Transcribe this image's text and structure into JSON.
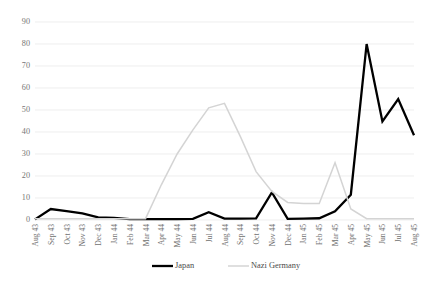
{
  "chart_data": {
    "type": "line",
    "title": "",
    "xlabel": "",
    "ylabel": "",
    "ylim": [
      0,
      90
    ],
    "ystep": 10,
    "grid": true,
    "legend_position": "bottom",
    "categories": [
      "Aug 43",
      "Sep 43",
      "Oct 43",
      "Nov 43",
      "Dec 43",
      "Jan 44",
      "Feb 44",
      "Mar 44",
      "Apr 44",
      "May 44",
      "Jun 44",
      "Jul 44",
      "Aug 44",
      "Sep 44",
      "Oct 44",
      "Nov 44",
      "Dec 44",
      "Jan 45",
      "Feb 45",
      "Mar 45",
      "Apr 45",
      "May 45",
      "Jun 45",
      "Jul 45",
      "Aug 45"
    ],
    "ytick_labels": [
      "0",
      "10",
      "20",
      "30",
      "40",
      "50",
      "60",
      "70",
      "80",
      "90"
    ],
    "series": [
      {
        "name": "Japan",
        "color": "#000000",
        "width": 2.3,
        "values": [
          0.3,
          5.0,
          4.0,
          3.0,
          1.2,
          1.0,
          0.4,
          0.4,
          0.4,
          0.4,
          0.5,
          3.5,
          0.6,
          0.6,
          0.7,
          12.5,
          0.5,
          0.6,
          0.8,
          4.0,
          11.5,
          80.0,
          44.8,
          55.0,
          38.5
        ]
      },
      {
        "name": "Nazi Germany",
        "color": "#d4d4d4",
        "width": 1.5,
        "values": [
          0.6,
          0.6,
          0.6,
          0.6,
          0.6,
          0.6,
          0.6,
          0.6,
          16.0,
          30.0,
          41.0,
          51.0,
          53.0,
          38.0,
          22.0,
          13.0,
          8.0,
          7.5,
          7.5,
          26.0,
          5.0,
          0.6,
          0.6,
          0.6,
          0.6
        ]
      }
    ]
  },
  "legend": {
    "items": [
      {
        "label": "Japan"
      },
      {
        "label": "Nazi Germany"
      }
    ]
  }
}
